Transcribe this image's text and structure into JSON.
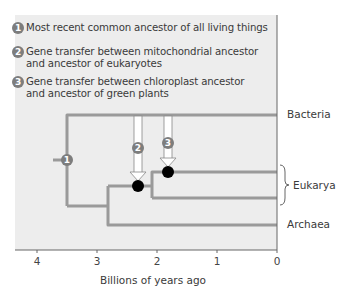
{
  "legend": [
    {
      "number": "1",
      "lines": [
        "Most recent common ancestor of all living things"
      ]
    },
    {
      "number": "2",
      "lines": [
        "Gene transfer between mitochondrial ancestor",
        "and ancestor of eukaryotes"
      ]
    },
    {
      "number": "3",
      "lines": [
        "Gene transfer between chloroplast ancestor",
        "and ancestor of green plants"
      ]
    }
  ],
  "taxa": {
    "bacteria": "Bacteria",
    "eukarya": "Eukarya",
    "archaea": "Archaea"
  },
  "markers": {
    "root": "1",
    "mitochondrial": "2",
    "chloroplast": "3"
  },
  "axis": {
    "title": "Billions of years ago",
    "ticks": [
      "4",
      "3",
      "2",
      "1",
      "0"
    ]
  },
  "tree": {
    "root_time": 3.5,
    "archaea_eukarya_split": 2.8,
    "mitochondrial_event": 2.3,
    "eukarya_split": 2.1,
    "chloroplast_event": 1.8
  },
  "colors": {
    "branch": "#9a9a9a",
    "panel": "#ededed",
    "badge": "#7d7d7d",
    "node": "#000000"
  }
}
